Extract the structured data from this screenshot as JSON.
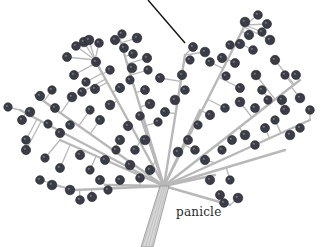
{
  "figure": {
    "label": {
      "text": "panicle",
      "x": 176,
      "y": 205
    },
    "leader_line": {
      "x1": 148,
      "y1": 0,
      "x2": 185,
      "y2": 43
    },
    "colors": {
      "background": "#ffffff",
      "berry": "#3a3d45",
      "berry_highlight": "#8a8d95",
      "stem": "#b8b8b8",
      "stem_edge": "#8e8e8e",
      "leader": "#111111"
    },
    "stem": {
      "x1": 164,
      "y1": 186,
      "x2": 147,
      "y2": 247
    },
    "branches": [
      [
        164,
        186,
        60,
        140
      ],
      [
        164,
        186,
        35,
        95
      ],
      [
        164,
        186,
        95,
        60
      ],
      [
        164,
        186,
        120,
        40
      ],
      [
        164,
        186,
        185,
        55
      ],
      [
        164,
        186,
        245,
        25
      ],
      [
        164,
        186,
        300,
        80
      ],
      [
        164,
        186,
        310,
        120
      ],
      [
        164,
        186,
        285,
        150
      ],
      [
        164,
        186,
        215,
        175
      ],
      [
        164,
        186,
        230,
        205
      ],
      [
        164,
        186,
        75,
        190
      ],
      [
        164,
        186,
        140,
        115
      ],
      [
        164,
        186,
        200,
        110
      ],
      [
        164,
        186,
        20,
        110
      ],
      [
        164,
        186,
        105,
        185
      ]
    ],
    "berries": [
      [
        8,
        107
      ],
      [
        22,
        120
      ],
      [
        30,
        112
      ],
      [
        26,
        140
      ],
      [
        40,
        96
      ],
      [
        52,
        90
      ],
      [
        55,
        108
      ],
      [
        72,
        97
      ],
      [
        82,
        92
      ],
      [
        95,
        89
      ],
      [
        90,
        110
      ],
      [
        100,
        120
      ],
      [
        110,
        105
      ],
      [
        70,
        125
      ],
      [
        60,
        133
      ],
      [
        48,
        124
      ],
      [
        67,
        57
      ],
      [
        84,
        42
      ],
      [
        99,
        43
      ],
      [
        115,
        40
      ],
      [
        122,
        34
      ],
      [
        124,
        48
      ],
      [
        137,
        38
      ],
      [
        133,
        54
      ],
      [
        147,
        58
      ],
      [
        148,
        70
      ],
      [
        160,
        78
      ],
      [
        132,
        68
      ],
      [
        110,
        70
      ],
      [
        96,
        62
      ],
      [
        86,
        82
      ],
      [
        74,
        75
      ],
      [
        89,
        40
      ],
      [
        76,
        46
      ],
      [
        120,
        88
      ],
      [
        130,
        80
      ],
      [
        145,
        90
      ],
      [
        150,
        104
      ],
      [
        140,
        116
      ],
      [
        128,
        126
      ],
      [
        158,
        122
      ],
      [
        165,
        112
      ],
      [
        175,
        100
      ],
      [
        185,
        90
      ],
      [
        182,
        75
      ],
      [
        190,
        60
      ],
      [
        193,
        47
      ],
      [
        205,
        52
      ],
      [
        210,
        62
      ],
      [
        222,
        58
      ],
      [
        226,
        76
      ],
      [
        235,
        63
      ],
      [
        245,
        22
      ],
      [
        258,
        15
      ],
      [
        249,
        35
      ],
      [
        262,
        32
      ],
      [
        267,
        24
      ],
      [
        270,
        40
      ],
      [
        253,
        50
      ],
      [
        240,
        44
      ],
      [
        230,
        45
      ],
      [
        240,
        88
      ],
      [
        256,
        75
      ],
      [
        262,
        90
      ],
      [
        275,
        60
      ],
      [
        285,
        75
      ],
      [
        296,
        75
      ],
      [
        300,
        98
      ],
      [
        310,
        110
      ],
      [
        285,
        110
      ],
      [
        275,
        120
      ],
      [
        265,
        128
      ],
      [
        290,
        135
      ],
      [
        300,
        128
      ],
      [
        282,
        100
      ],
      [
        268,
        100
      ],
      [
        255,
        108
      ],
      [
        240,
        102
      ],
      [
        225,
        108
      ],
      [
        210,
        115
      ],
      [
        198,
        125
      ],
      [
        188,
        140
      ],
      [
        178,
        152
      ],
      [
        195,
        150
      ],
      [
        205,
        160
      ],
      [
        222,
        150
      ],
      [
        232,
        140
      ],
      [
        245,
        135
      ],
      [
        255,
        145
      ],
      [
        210,
        180
      ],
      [
        230,
        180
      ],
      [
        220,
        195
      ],
      [
        238,
        198
      ],
      [
        224,
        203
      ],
      [
        26,
        150
      ],
      [
        45,
        158
      ],
      [
        60,
        168
      ],
      [
        52,
        185
      ],
      [
        40,
        180
      ],
      [
        80,
        155
      ],
      [
        90,
        170
      ],
      [
        100,
        180
      ],
      [
        70,
        190
      ],
      [
        80,
        200
      ],
      [
        92,
        197
      ],
      [
        108,
        190
      ],
      [
        120,
        180
      ],
      [
        130,
        165
      ],
      [
        140,
        178
      ],
      [
        150,
        170
      ],
      [
        116,
        150
      ],
      [
        105,
        160
      ],
      [
        145,
        140
      ],
      [
        135,
        150
      ],
      [
        120,
        140
      ]
    ]
  }
}
